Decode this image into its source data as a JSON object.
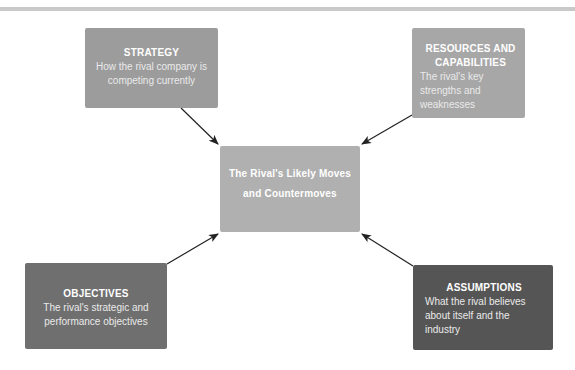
{
  "diagram": {
    "type": "hub-and-spoke",
    "center": {
      "title": "The Rival's Likely Moves and Countermoves",
      "color": "#b0b0b0"
    },
    "nodes": [
      {
        "id": "strategy",
        "title": "STRATEGY",
        "description": "How the rival company is competing currently",
        "color": "#9c9c9c",
        "position": "top-left"
      },
      {
        "id": "resources",
        "title": "RESOURCES AND CAPABILITIES",
        "description": "The rival's key strengths and weaknesses",
        "color": "#a7a7a7",
        "position": "top-right"
      },
      {
        "id": "objectives",
        "title": "OBJECTIVES",
        "description": "The rival's strategic and performance objectives",
        "color": "#6f6f6f",
        "position": "bottom-left"
      },
      {
        "id": "assumptions",
        "title": "ASSUMPTIONS",
        "description": "What the rival believes about itself and the industry",
        "color": "#555555",
        "position": "bottom-right"
      }
    ],
    "edges": [
      {
        "from": "strategy",
        "to": "center"
      },
      {
        "from": "resources",
        "to": "center"
      },
      {
        "from": "objectives",
        "to": "center"
      },
      {
        "from": "assumptions",
        "to": "center"
      }
    ],
    "arrow_color": "#222222"
  }
}
